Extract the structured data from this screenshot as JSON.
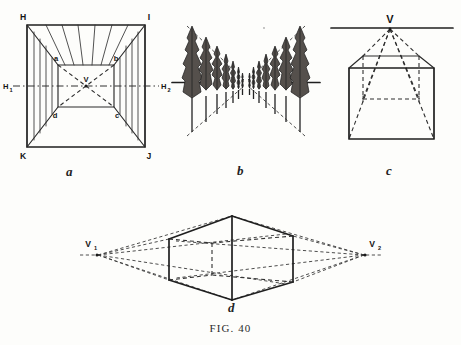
{
  "plate": {
    "caption": "FIG. 40",
    "figures": [
      {
        "key": "a",
        "label": "a",
        "title": "One-point perspective interior box with central vanishing point",
        "vertex_labels": {
          "top_left": "H",
          "top_right": "I",
          "bottom_left": "K",
          "bottom_right": "J",
          "inner_top_left": "a",
          "inner_top_right": "b",
          "inner_bottom_right": "c",
          "inner_bottom_left": "d",
          "vanishing_point": "V",
          "horizon_left": "H",
          "horizon_left_sub": "1",
          "horizon_right": "H",
          "horizon_right_sub": "2"
        }
      },
      {
        "key": "b",
        "label": "b",
        "title": "Two receding rows of poplar trees converging at a vanishing point",
        "tree_count_left": 7,
        "tree_count_right": 7
      },
      {
        "key": "c",
        "label": "c",
        "title": "Cube in one-point perspective beneath the horizon line",
        "vertex_labels": {
          "vanishing_point": "V"
        }
      },
      {
        "key": "d",
        "label": "d",
        "title": "Cube in two-point perspective between two vanishing points",
        "vertex_labels": {
          "vanishing_point_left": "V",
          "vanishing_point_left_sub": "1",
          "vanishing_point_right": "V",
          "vanishing_point_right_sub": "2"
        }
      }
    ]
  },
  "colors": {
    "paper": "#fdfdfb",
    "ink": "#2a2a2a",
    "ink_heavy": "#1f1f1f",
    "ink_light": "#3a3a3a",
    "foliage": "#55504c"
  }
}
